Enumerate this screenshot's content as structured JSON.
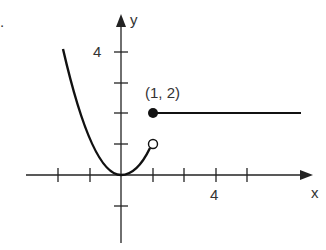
{
  "chart_data": {
    "type": "line",
    "title": "",
    "xlabel": "x",
    "ylabel": "y",
    "x_tick_labels": [
      "4"
    ],
    "y_tick_labels": [
      "4"
    ],
    "xlim": [
      -3,
      6
    ],
    "ylim": [
      -2,
      5
    ],
    "grid": false,
    "series": [
      {
        "name": "parabola y = x^2",
        "x": [
          -1.75,
          -1.5,
          -1,
          -0.5,
          0,
          0.5,
          1
        ],
        "y": [
          3.06,
          2.25,
          1,
          0.25,
          0,
          0.25,
          1
        ],
        "end_marker": "open circle at (1, 1)"
      },
      {
        "name": "horizontal segment y = 2",
        "x": [
          1,
          5.75
        ],
        "y": [
          2,
          2
        ],
        "start_marker": "closed dot at (1, 2)"
      }
    ],
    "annotations": [
      {
        "text": "(1, 2)",
        "x": 1,
        "y": 2
      }
    ]
  },
  "labels": {
    "y_axis": "y",
    "x_axis": "x",
    "y_tick": "4",
    "x_tick": "4",
    "point": "(1, 2)",
    "stray": "."
  }
}
